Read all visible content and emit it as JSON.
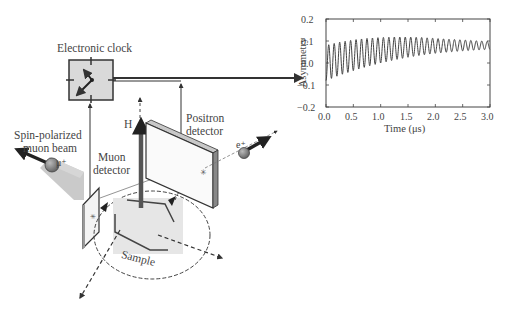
{
  "diagram": {
    "labels": {
      "clock": "Electronic clock",
      "beam_line1": "Spin-polarized",
      "beam_line2": "muon beam",
      "muon_particle": "μ⁺",
      "muon_detector_line1": "Muon",
      "muon_detector_line2": "detector",
      "field": "H",
      "positron_detector_line1": "Positron",
      "positron_detector_line2": "detector",
      "positron_particle": "e⁺",
      "sample": "Sample"
    },
    "icons": [
      "clock-icon",
      "muon-sphere-icon",
      "positron-sphere-icon",
      "field-arrow-icon"
    ],
    "colors": {
      "line": "#333333",
      "clock_fill": "#d9d9d9",
      "beam": "#bdbdbd",
      "sample": "#e6e6e6",
      "particle": "#888888",
      "field_arrow": "#555555"
    }
  },
  "chart_data": {
    "type": "line",
    "title": "",
    "xlabel": "Time (μs)",
    "ylabel": "Asymmetry",
    "xlim": [
      0.0,
      3.0
    ],
    "ylim": [
      -0.2,
      0.2
    ],
    "xticks": [
      "0.0",
      "0.5",
      "1.0",
      "1.5",
      "2.0",
      "2.5",
      "3.0"
    ],
    "yticks": [
      "0.2",
      "0.1",
      "0.0",
      "−0.1",
      "−0.2"
    ],
    "grid": false,
    "legend": null,
    "series": [
      {
        "name": "μSR asymmetry",
        "description": "Damped oscillation (~10 MHz) around a baseline rising from ~0.0 to ~0.08; amplitude ~0.08 at t=0 decaying to ~0.02 by t=3.0 μs",
        "x": [
          0.0,
          0.25,
          0.5,
          0.75,
          1.0,
          1.25,
          1.5,
          1.75,
          2.0,
          2.25,
          2.5,
          2.75,
          3.0
        ],
        "baseline": [
          0.0,
          0.02,
          0.035,
          0.048,
          0.058,
          0.066,
          0.072,
          0.076,
          0.078,
          0.079,
          0.08,
          0.08,
          0.08
        ],
        "amplitude": [
          0.08,
          0.075,
          0.07,
          0.064,
          0.058,
          0.052,
          0.046,
          0.04,
          0.034,
          0.029,
          0.025,
          0.021,
          0.018
        ],
        "frequency_per_us": 10
      }
    ]
  },
  "plot": {
    "xticks": [
      "0.0",
      "0.5",
      "1.0",
      "1.5",
      "2.0",
      "2.5",
      "3.0"
    ],
    "yticks": [
      "0.2",
      "0.1",
      "0.0",
      "−0.1",
      "−0.2"
    ],
    "xlabel": "Time (μs)",
    "ylabel": "Asymmetry"
  }
}
